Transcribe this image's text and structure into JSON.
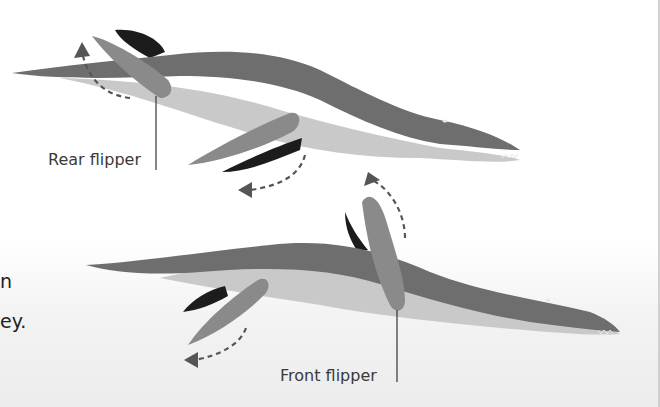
{
  "diagram": {
    "labels": {
      "rear_flipper": "Rear flipper",
      "front_flipper": "Front flipper"
    },
    "cut_text_fragments": [
      "n",
      "ey."
    ],
    "colors": {
      "back": "#6e6e6e",
      "belly": "#c9c9c9",
      "flipper_near": "#8a8a8a",
      "flipper_far": "#1c1c1c",
      "arrow": "#555555",
      "background": "#ffffff"
    }
  }
}
